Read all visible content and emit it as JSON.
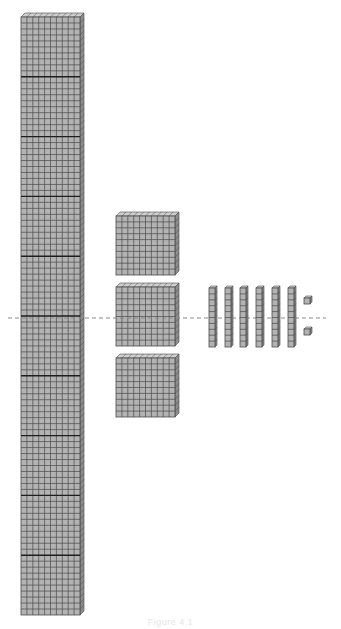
{
  "figure": {
    "caption": "Figure 4.1",
    "colors": {
      "block_fill": "#b3b3b3",
      "block_top": "#cfcfcf",
      "block_side": "#8c8c8c",
      "grid_line": "#4a4a4a",
      "thick_line": "#1e1e1e",
      "dashed_line": "#8a8a8a"
    }
  },
  "blocks": {
    "thousand_column": {
      "label": "thousand",
      "count": 1,
      "x": 21,
      "y": 17,
      "w": 59,
      "h": 598,
      "cols": 10,
      "rows": 100,
      "flat_divisions": 10
    },
    "hundred_flats": [
      {
        "label": "hundred",
        "x": 116,
        "y": 216,
        "w": 59,
        "h": 59
      },
      {
        "label": "hundred",
        "x": 116,
        "y": 287,
        "w": 59,
        "h": 59
      },
      {
        "label": "hundred",
        "x": 116,
        "y": 358,
        "w": 59,
        "h": 59
      }
    ],
    "ten_rods": [
      {
        "label": "ten",
        "x": 209,
        "y": 288,
        "w": 6,
        "h": 59
      },
      {
        "label": "ten",
        "x": 225,
        "y": 288,
        "w": 6,
        "h": 59
      },
      {
        "label": "ten",
        "x": 240,
        "y": 288,
        "w": 6,
        "h": 59
      },
      {
        "label": "ten",
        "x": 256,
        "y": 288,
        "w": 6,
        "h": 59
      },
      {
        "label": "ten",
        "x": 272,
        "y": 288,
        "w": 6,
        "h": 59
      },
      {
        "label": "ten",
        "x": 288,
        "y": 288,
        "w": 6,
        "h": 59
      }
    ],
    "unit_cubes": [
      {
        "label": "one",
        "x": 304,
        "y": 298,
        "w": 6,
        "h": 6
      },
      {
        "label": "one",
        "x": 304,
        "y": 329,
        "w": 6,
        "h": 6
      }
    ]
  },
  "reference_line": {
    "x1": 8,
    "x2": 326,
    "y": 318,
    "style": "dashed"
  }
}
